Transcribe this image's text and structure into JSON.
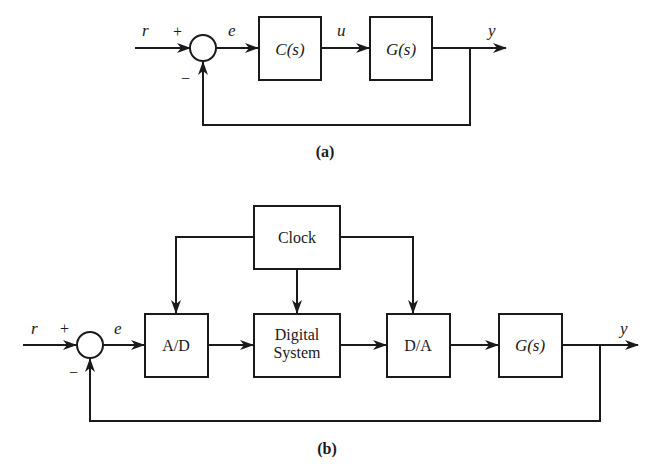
{
  "diagram_a": {
    "caption": "(a)",
    "signals": {
      "input": "r",
      "error": "e",
      "control": "u",
      "output": "y"
    },
    "summing_junction": {
      "plus_sign": "+",
      "minus_sign": "−"
    },
    "blocks": {
      "controller": "C(s)",
      "plant": "G(s)"
    }
  },
  "diagram_b": {
    "caption": "(b)",
    "signals": {
      "input": "r",
      "error": "e",
      "output": "y"
    },
    "summing_junction": {
      "plus_sign": "+",
      "minus_sign": "−"
    },
    "blocks": {
      "clock": "Clock",
      "adc": "A/D",
      "digital_system_line1": "Digital",
      "digital_system_line2": "System",
      "dac": "D/A",
      "plant": "G(s)"
    }
  }
}
